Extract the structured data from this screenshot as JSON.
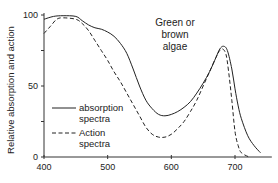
{
  "chart_data": {
    "type": "line",
    "title": "",
    "annotation": [
      "Green or",
      "brown",
      "algae"
    ],
    "xlabel": "",
    "ylabel": "Relative absorption and action",
    "xlim": [
      400,
      750
    ],
    "ylim": [
      0,
      100
    ],
    "x_ticks": [
      400,
      500,
      600,
      700
    ],
    "x_tick_labels": [
      "400",
      "500",
      "600",
      "700"
    ],
    "y_ticks": [
      0,
      25,
      50,
      75,
      100
    ],
    "y_tick_labels": [
      "0",
      "",
      "50",
      "",
      "100"
    ],
    "grid": false,
    "legend": {
      "placement": "bottom-left",
      "entries": [
        {
          "name": "absorption spectra",
          "lines": [
            "absorption",
            "spectra"
          ],
          "style": "solid"
        },
        {
          "name": "Action spectra",
          "lines": [
            "Action",
            "spectra"
          ],
          "style": "dashed"
        }
      ]
    },
    "series": [
      {
        "name": "absorption spectra",
        "style": "solid",
        "x": [
          400,
          415,
          430,
          450,
          460,
          470,
          480,
          490,
          500,
          510,
          520,
          530,
          540,
          550,
          560,
          570,
          580,
          590,
          600,
          610,
          620,
          630,
          640,
          650,
          660,
          670,
          676,
          682,
          688,
          695,
          700,
          705,
          710,
          720,
          730,
          740
        ],
        "y": [
          97,
          99,
          99.5,
          99,
          96,
          93,
          91,
          90,
          88,
          85,
          80,
          73,
          62,
          50,
          40,
          34,
          30,
          29,
          30,
          32,
          35,
          39,
          45,
          52,
          60,
          70,
          76,
          78,
          75,
          62,
          48,
          36,
          27,
          15,
          8,
          3
        ]
      },
      {
        "name": "Action spectra",
        "style": "dashed",
        "x": [
          400,
          410,
          420,
          430,
          450,
          460,
          470,
          480,
          490,
          500,
          510,
          520,
          530,
          540,
          550,
          560,
          570,
          580,
          590,
          600,
          610,
          620,
          630,
          640,
          650,
          660,
          670,
          676,
          681,
          686,
          690,
          695,
          700,
          705,
          710,
          722
        ],
        "y": [
          87,
          92,
          97,
          98,
          97,
          94,
          89,
          82,
          75,
          68,
          60,
          53,
          45,
          37,
          29,
          21,
          16,
          14,
          14,
          16,
          20,
          25,
          32,
          40,
          50,
          60,
          70,
          75,
          76,
          72,
          60,
          40,
          18,
          8,
          3,
          0
        ]
      }
    ]
  }
}
